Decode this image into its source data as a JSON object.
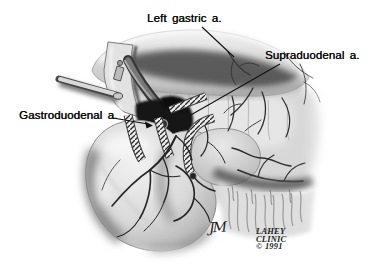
{
  "figure": {
    "labels": {
      "left_gastric": "Left gastric a.",
      "supraduodenal": "Supraduodenal a.",
      "gastroduodenal": "Gastroduodenal a."
    },
    "credits": {
      "monogram": "JM",
      "publisher_lines": [
        "LAHEY",
        "CLINIC",
        "© 1991"
      ]
    },
    "colors": {
      "ink": "#0f0f0f",
      "paper": "#ffffff",
      "shade_dark": "#4f4f4f",
      "shade_light": "#d8d8d8"
    }
  }
}
